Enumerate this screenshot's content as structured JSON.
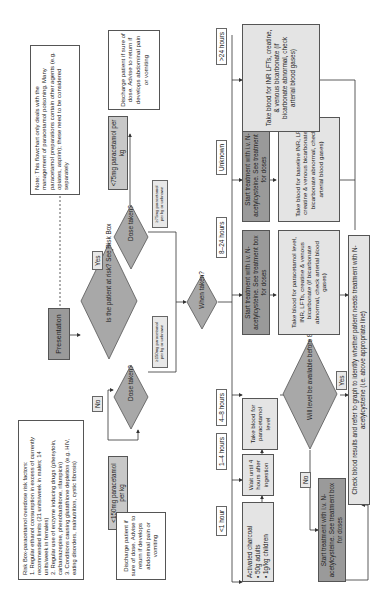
{
  "note": "Note:  This flowchart only deals with the management of paracetamol poisoning. Many paracetamol preparations contain other agents (e.g. opiates, aspirin); these need to be considered separately",
  "risk_box": {
    "title": "Risk Box-paracetamol overdose risk factors:",
    "items": [
      "1. Regular ethanol consumption in excess of currently recommended limits (21 units/week in males; 14 units/week in females)",
      "2. Regular use of enzyme inducing drugs (phenytoin, carbamazepine, phenobarbitone, rifampicin)",
      "3. Conditions causing glutathione depletion (e.g. HIV, eating disorders, malnutrition, cystic fibrosis)"
    ]
  },
  "presentation": "Presentation",
  "risk_question": "Is the patient at risk? See Risk Box",
  "yes_label": "Yes",
  "no_label": "No",
  "dose_taken": "Dose taken?",
  "high_risk": {
    "low_dose": "<75mg paracetamol per kg",
    "high_dose": "≥75mg paracetamol per kg or unknown",
    "discharge": "Discharge patient if sure of dose. Advise to return if develops abdominal pain or vomiting"
  },
  "low_risk": {
    "low_dose": "<150mg paracetamol per kg",
    "high_dose": "≥150mg paracetamol per kg or unknown",
    "discharge": "Discharge patient if sure of dose. Advise to return if develops abdominal pain or vomiting"
  },
  "when_taken": "When taken?",
  "time_labels": {
    "lt1": "<1 hour",
    "h1_4": "1–4 hours",
    "h4_8": "4–8 hours",
    "h8_24": "8–24 hours",
    "unknown": "Unknown",
    "gt24": ">24 hours"
  },
  "charcoal": {
    "title": "Activated charcoal",
    "items": [
      "50g adults",
      "1g/kg children"
    ]
  },
  "wait": "Wait until 4 hours after ingestion",
  "take_blood_level": "Take blood for paracetamol level",
  "will_level": "Will level be available before 8 hours",
  "yes2": "Yes",
  "no2": "No",
  "start_nac": "Start treatment with i.v. N-acetylcysteine. See treatment box for doses",
  "check_results": "Check blood results and refer to graph to identify whether patient needs treatment with N-acetylcysteine (i.e. above appropriate line)",
  "take_blood_full": "Take blood for paracetamol level, INR, LFTs, creatine & venous bicarbonate (if bicarbonate abnormal, check arterial blood gases)",
  "take_blood_baseline": "Take blood for baseline INR, LFTs, creatine & venous bicarbonate (if bicarbonate abnormal, check arterial blood gases)",
  "take_blood_24": "Take blood for INR LFTs, creatine, & venous bicarbonate (if bicarbonate abnormal, check arterial blood gases)",
  "colors": {
    "dark_box": "#9a9a9a",
    "light_box": "#e4e4e4",
    "diamond": "#a8a8a8",
    "line": "#333333"
  }
}
